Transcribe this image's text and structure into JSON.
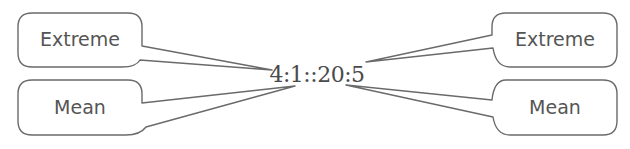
{
  "diagram": {
    "center_label": "4:1::20:5",
    "bubbles": [
      {
        "id": "top-left",
        "label": "Extreme"
      },
      {
        "id": "bottom-left",
        "label": "Mean"
      },
      {
        "id": "top-right",
        "label": "Extreme"
      },
      {
        "id": "bottom-right",
        "label": "Mean"
      }
    ]
  },
  "colors": {
    "stroke": "#6a6a6a",
    "text": "#555555",
    "background": "#ffffff"
  }
}
